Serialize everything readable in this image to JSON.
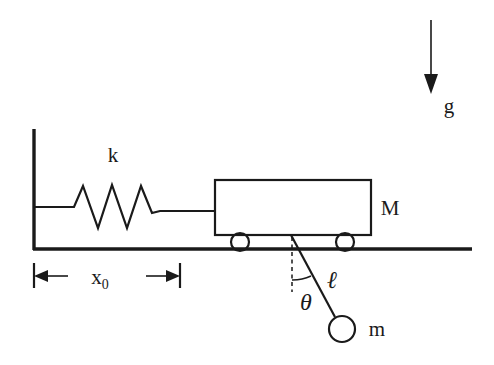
{
  "diagram": {
    "colors": {
      "ink": "#1a1a1a",
      "background": "#ffffff"
    },
    "labels": {
      "spring_constant": "k",
      "cart_mass": "M",
      "bob_mass": "m",
      "pendulum_length": "ℓ",
      "angle": "θ",
      "gravity": "g",
      "displacement": "x",
      "displacement_subscript": "0"
    },
    "elements": {
      "wall": "wall",
      "ground": "ground",
      "spring": "spring",
      "cart": "cart-body",
      "wheel_left": "wheel-left",
      "wheel_right": "wheel-right",
      "rod": "pendulum-rod",
      "bob": "pendulum-bob",
      "plumb_line": "vertical-reference-dashed",
      "angle_arc": "angle-arc",
      "gravity_arrow": "gravity-arrow",
      "dimension_line": "x0-dimension"
    }
  }
}
